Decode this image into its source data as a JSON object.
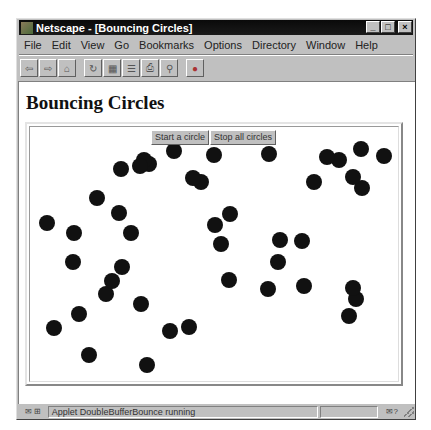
{
  "window": {
    "title": "Netscape - [Bouncing Circles]",
    "controls": [
      "_",
      "□",
      "×"
    ]
  },
  "menubar": {
    "items": [
      {
        "label": "File",
        "mnemonic": "F"
      },
      {
        "label": "Edit",
        "mnemonic": "E"
      },
      {
        "label": "View",
        "mnemonic": "V"
      },
      {
        "label": "Go",
        "mnemonic": "G"
      },
      {
        "label": "Bookmarks",
        "mnemonic": "B"
      },
      {
        "label": "Options",
        "mnemonic": "O"
      },
      {
        "label": "Directory",
        "mnemonic": "D"
      },
      {
        "label": "Window",
        "mnemonic": "W"
      },
      {
        "label": "Help",
        "mnemonic": "H"
      }
    ]
  },
  "toolbar": {
    "buttons": [
      {
        "name": "back",
        "glyph": "⇦"
      },
      {
        "name": "forward",
        "glyph": "⇨"
      },
      {
        "name": "home",
        "glyph": "⌂"
      },
      {
        "name": "reload",
        "glyph": "↻"
      },
      {
        "name": "images",
        "glyph": "▦"
      },
      {
        "name": "open",
        "glyph": "☰"
      },
      {
        "name": "print",
        "glyph": "⎙"
      },
      {
        "name": "find",
        "glyph": "⚲"
      },
      {
        "name": "stop",
        "glyph": "●"
      }
    ]
  },
  "page": {
    "heading": "Bouncing Circles"
  },
  "applet": {
    "buttons": {
      "start": "Start a circle",
      "stop": "Stop all circles"
    },
    "circle_color": "#111111",
    "circles": [
      [
        120,
        168
      ],
      [
        139,
        165
      ],
      [
        143,
        159
      ],
      [
        148,
        163
      ],
      [
        173,
        150
      ],
      [
        192,
        177
      ],
      [
        200,
        181
      ],
      [
        96,
        197
      ],
      [
        118,
        212
      ],
      [
        46,
        222
      ],
      [
        73,
        232
      ],
      [
        130,
        232
      ],
      [
        72,
        261
      ],
      [
        121,
        266
      ],
      [
        111,
        280
      ],
      [
        105,
        293
      ],
      [
        140,
        303
      ],
      [
        78,
        313
      ],
      [
        53,
        327
      ],
      [
        169,
        330
      ],
      [
        188,
        326
      ],
      [
        88,
        354
      ],
      [
        146,
        364
      ],
      [
        213,
        154
      ],
      [
        268,
        153
      ],
      [
        326,
        156
      ],
      [
        338,
        159
      ],
      [
        360,
        148
      ],
      [
        383,
        155
      ],
      [
        313,
        181
      ],
      [
        352,
        176
      ],
      [
        361,
        187
      ],
      [
        229,
        213
      ],
      [
        214,
        224
      ],
      [
        220,
        243
      ],
      [
        279,
        239
      ],
      [
        301,
        240
      ],
      [
        277,
        261
      ],
      [
        228,
        279
      ],
      [
        267,
        288
      ],
      [
        303,
        285
      ],
      [
        352,
        287
      ],
      [
        355,
        298
      ],
      [
        348,
        315
      ]
    ]
  },
  "statusbar": {
    "icons": "✉ ⊞",
    "message": "Applet DoubleBufferBounce running",
    "progress": "",
    "security": "✉?"
  }
}
